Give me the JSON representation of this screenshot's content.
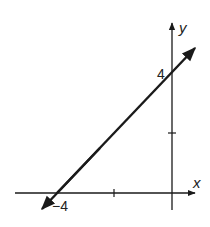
{
  "diagram": {
    "type": "coordinate-graph",
    "axes": {
      "x_label": "x",
      "y_label": "y"
    },
    "labels": {
      "y_intercept": "4",
      "x_intercept": "−4"
    },
    "line": {
      "slope": 1,
      "y_intercept": 4,
      "x_intercept": -4,
      "equation": "y = x + 4",
      "arrows": "both"
    },
    "ticks": {
      "x": [
        -4,
        -2
      ],
      "y": [
        2,
        4
      ]
    },
    "colors": {
      "ink": "#1a1a1a",
      "background": "#ffffff"
    }
  }
}
